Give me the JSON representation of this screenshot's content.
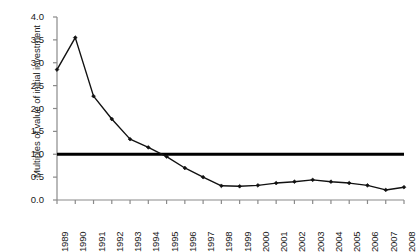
{
  "chart_data": {
    "type": "line",
    "title": "",
    "xlabel": "",
    "ylabel": "Multiples of value of initial investment",
    "ylim": [
      0.0,
      4.0
    ],
    "ytick_labels": [
      "0.0",
      "0.5",
      "1.0",
      "1.5",
      "2.0",
      "2.5",
      "3.0",
      "3.5",
      "4.0"
    ],
    "ytick_values": [
      0.0,
      0.5,
      1.0,
      1.5,
      2.0,
      2.5,
      3.0,
      3.5,
      4.0
    ],
    "grid": false,
    "legend": "none",
    "categories": [
      "1989",
      "1990",
      "1991",
      "1992",
      "1993",
      "1994",
      "1995",
      "1996",
      "1997",
      "1998",
      "1999",
      "2000",
      "2001",
      "2002",
      "2003",
      "2004",
      "2005",
      "2006",
      "2007",
      "2008"
    ],
    "x": [
      1989,
      1990,
      1991,
      1992,
      1993,
      1994,
      1995,
      1996,
      1997,
      1998,
      1999,
      2000,
      2001,
      2002,
      2003,
      2004,
      2005,
      2006,
      2007,
      2008
    ],
    "series": [
      {
        "name": "Multiples of value of initial investment",
        "color": "#111111",
        "marker": "diamond",
        "values": [
          2.85,
          3.55,
          2.27,
          1.77,
          1.33,
          1.15,
          0.95,
          0.7,
          0.5,
          0.31,
          0.3,
          0.32,
          0.37,
          0.4,
          0.44,
          0.4,
          0.37,
          0.32,
          0.22,
          0.28
        ]
      }
    ],
    "reference_lines": [
      {
        "name": "break-even",
        "orientation": "horizontal",
        "value": 1.0,
        "color": "#000000",
        "width": 3
      }
    ]
  }
}
